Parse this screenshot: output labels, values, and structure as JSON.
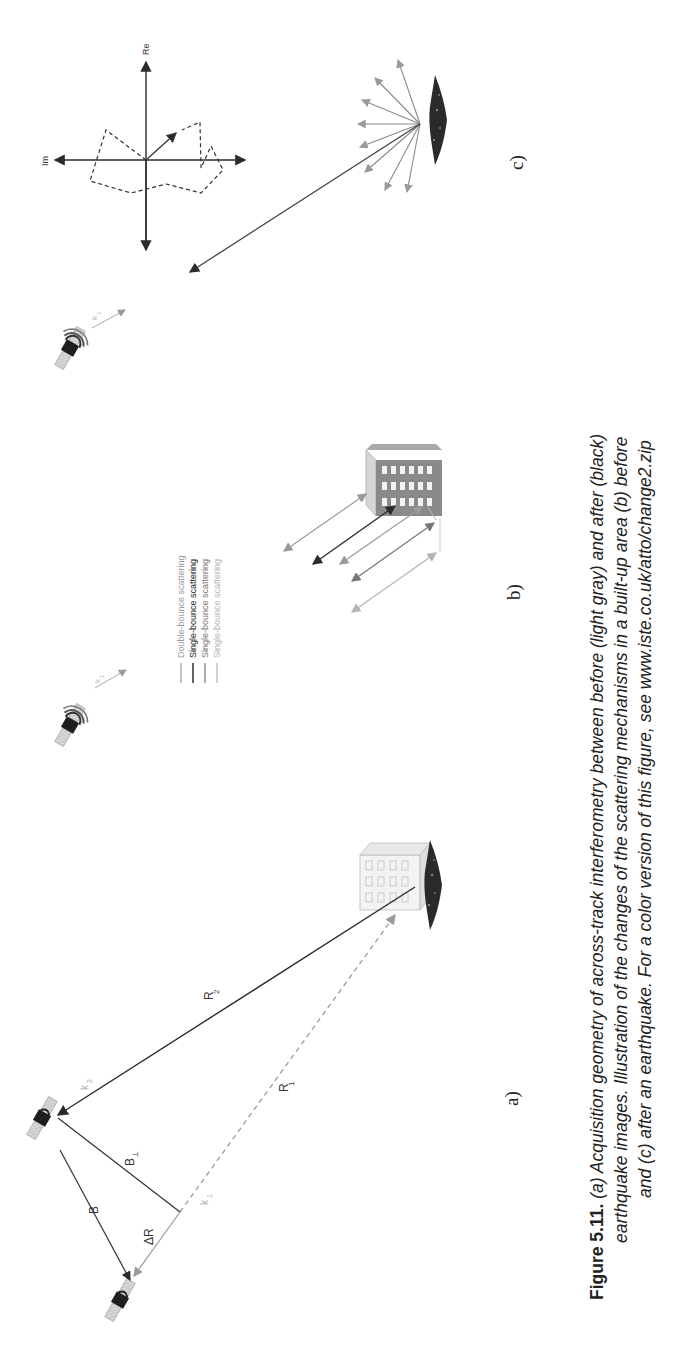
{
  "figure": {
    "number": "Figure 5.11.",
    "caption_lines": [
      "(a) Acquisition geometry of across-track interferometry between before (light gray) and after (black)",
      "earthquake images. Illustration of the changes of the scattering mechanisms in a built-up area (b) before",
      "and (c) after an earthquake. For a color version of this figure, see www.iste.co.uk/atto/change2.zip"
    ],
    "orientation": "rotated 90° counter-clockwise (landscape page)"
  },
  "panels": {
    "a": {
      "label": "a)",
      "symbols": {
        "R1": "R",
        "R1_sub": "1",
        "R2": "R",
        "R2_sub": "2",
        "B": "B",
        "B_perp": "B",
        "B_perp_sub": "⊥",
        "delta_R": "ΔR",
        "k1": "k",
        "k1_sub": "1",
        "k2": "k",
        "k2_sub": "2"
      }
    },
    "b": {
      "label": "b)",
      "k_label": "k",
      "k_sub": "1",
      "legend": [
        {
          "label": "Double-bounce scattering",
          "color": "#9a9a9a"
        },
        {
          "label": "Single-bounce scattering",
          "color": "#222222"
        },
        {
          "label": "Single-bounce scattering",
          "color": "#777777"
        },
        {
          "label": "Single-bounce scattering",
          "color": "#b5b5b5"
        }
      ]
    },
    "c": {
      "label": "c)",
      "k_label": "k",
      "k_sub": "2",
      "axes": {
        "re": "Re",
        "im": "Im"
      }
    }
  },
  "colors": {
    "before": "#9a9a9a",
    "after": "#2b2b2b",
    "text": "#222222"
  }
}
